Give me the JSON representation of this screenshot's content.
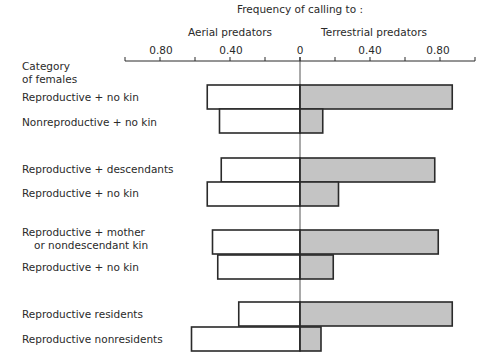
{
  "chart_data": {
    "type": "bar",
    "orientation": "horizontal-diverging",
    "title": "Frequency of calling to :",
    "left_axis_label": "Aerial predators",
    "right_axis_label": "Terrestrial predators",
    "ylabel": "Category of females",
    "ylabel_lines": [
      "Category",
      "of females"
    ],
    "tick_labels": [
      "0.80",
      "0.40",
      "0",
      "0.40",
      "0.80"
    ],
    "xlim_left": [
      0,
      1.0
    ],
    "xlim_right": [
      0,
      1.0
    ],
    "minor_tick_step": 0.2,
    "grid": false,
    "legend": null,
    "categories": [
      "Reproductive + no kin",
      "Nonreproductive + no kin",
      "Reproductive + descendants",
      "Reproductive + no kin",
      "Reproductive + mother or nondescendant kin",
      "Reproductive + no kin",
      "Reproductive residents",
      "Reproductive nonresidents"
    ],
    "category_label_lines": [
      [
        "Reproductive + no kin"
      ],
      [
        "Nonreproductive + no kin"
      ],
      [
        "Reproductive + descendants"
      ],
      [
        "Reproductive + no kin"
      ],
      [
        "Reproductive + mother",
        "or nondescendant kin"
      ],
      [
        "Reproductive + no kin"
      ],
      [
        "Reproductive residents"
      ],
      [
        "Reproductive nonresidents"
      ]
    ],
    "groups": [
      [
        0,
        1
      ],
      [
        2,
        3
      ],
      [
        4,
        5
      ],
      [
        6,
        7
      ]
    ],
    "series": [
      {
        "name": "Aerial predators",
        "side": "left",
        "color": "#ffffff",
        "values": [
          0.53,
          0.46,
          0.45,
          0.53,
          0.5,
          0.47,
          0.35,
          0.62
        ]
      },
      {
        "name": "Terrestrial predators",
        "side": "right",
        "color": "#c4c4c4",
        "values": [
          0.87,
          0.13,
          0.77,
          0.22,
          0.79,
          0.19,
          0.87,
          0.12
        ]
      }
    ]
  },
  "colors": {
    "stroke": "#2a2a2a",
    "terrestrial_fill": "#c4c4c4",
    "aerial_fill": "#ffffff"
  }
}
